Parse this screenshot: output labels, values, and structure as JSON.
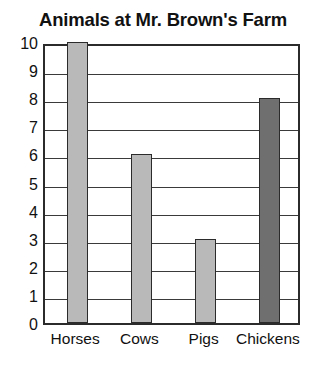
{
  "chart_data": {
    "type": "bar",
    "title": "Animals at Mr. Brown's Farm",
    "xlabel": "",
    "ylabel": "",
    "categories": [
      "Horses",
      "Cows",
      "Pigs",
      "Chickens"
    ],
    "values": [
      10,
      6,
      3,
      8
    ],
    "ylim": [
      0,
      10
    ],
    "y_ticks": [
      "0",
      "1",
      "2",
      "3",
      "4",
      "5",
      "6",
      "7",
      "8",
      "9",
      "10"
    ],
    "grid": true,
    "legend": "none",
    "bar_colors": [
      "#b9b9b9",
      "#b9b9b9",
      "#b9b9b9",
      "#6f6f6f"
    ],
    "bar_outline_color": "#2b2b2b",
    "axis_color": "#2b2b2b",
    "gridline_color": "#3a3a3a",
    "background_color": "#ffffff",
    "text_color": "#111111"
  }
}
